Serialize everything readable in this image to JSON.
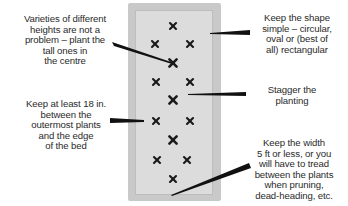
{
  "diagram": {
    "bed": {
      "shape": "rectangle",
      "colors": {
        "frame": "#c9c9c9",
        "fill": "#dcdcdc",
        "marker": "#1a1a1a",
        "leader": "#111111"
      }
    },
    "plants": [
      {
        "x": 173,
        "y": 26,
        "size": "small"
      },
      {
        "x": 155,
        "y": 44,
        "size": "small"
      },
      {
        "x": 190,
        "y": 44,
        "size": "small"
      },
      {
        "x": 173,
        "y": 63,
        "size": "large"
      },
      {
        "x": 156,
        "y": 82,
        "size": "small"
      },
      {
        "x": 190,
        "y": 82,
        "size": "small"
      },
      {
        "x": 173,
        "y": 100,
        "size": "large"
      },
      {
        "x": 156,
        "y": 121,
        "size": "small"
      },
      {
        "x": 190,
        "y": 121,
        "size": "small"
      },
      {
        "x": 173,
        "y": 140,
        "size": "large"
      },
      {
        "x": 157,
        "y": 160,
        "size": "small"
      },
      {
        "x": 187,
        "y": 160,
        "size": "small"
      },
      {
        "x": 173,
        "y": 179,
        "size": "small"
      }
    ],
    "annotations": [
      {
        "id": "heights",
        "text": "Varieties of different\nheights are not a\nproblem – plant the\ntall ones in\nthe centre"
      },
      {
        "id": "shape",
        "text": "Keep the shape\nsimple – circular,\noval or (best of\nall) rectangular"
      },
      {
        "id": "stagger",
        "text": "Stagger the\nplanting"
      },
      {
        "id": "edge",
        "text": "Keep at least 18 in.\nbetween the\noutermost plants\nand the edge\nof the bed"
      },
      {
        "id": "width",
        "text": "Keep the width\n5 ft or less, or you\nwill have to tread\nbetween the plants\nwhen pruning,\ndead-heading, etc."
      }
    ]
  }
}
